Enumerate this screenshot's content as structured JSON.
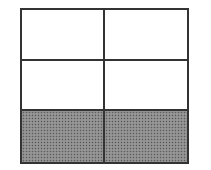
{
  "diagram": {
    "type": "grid",
    "rows": 3,
    "columns": 2,
    "cells": [
      {
        "row": 1,
        "col": 1,
        "shaded": false
      },
      {
        "row": 1,
        "col": 2,
        "shaded": false
      },
      {
        "row": 2,
        "col": 1,
        "shaded": false
      },
      {
        "row": 2,
        "col": 2,
        "shaded": false
      },
      {
        "row": 3,
        "col": 1,
        "shaded": true
      },
      {
        "row": 3,
        "col": 2,
        "shaded": true
      }
    ],
    "shaded_fraction": "2/6",
    "colors": {
      "border": "#333333",
      "fill": "#ffffff",
      "shade": "#8a8a8a"
    }
  }
}
